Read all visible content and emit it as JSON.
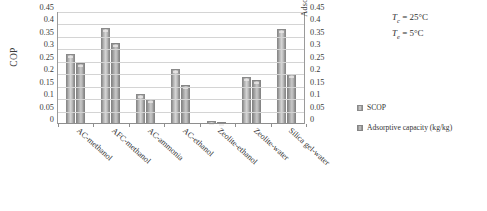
{
  "chart_data": {
    "type": "bar",
    "title": "",
    "categories": [
      "AC-methanol",
      "AFC-methanol",
      "AC-ammonia",
      "AC-ethanol",
      "Zeolite-ethanol",
      "Zeolite-water",
      "Silica gel-water"
    ],
    "series": [
      {
        "name": "SCOP",
        "values": [
          0.28,
          0.385,
          0.12,
          0.22,
          0.012,
          0.19,
          0.38
        ]
      },
      {
        "name": "Adsorptive capacity (kg/kg)",
        "values": [
          0.245,
          0.325,
          0.1,
          0.155,
          0.01,
          0.175,
          0.2
        ]
      }
    ],
    "xlabel": "",
    "ylabel": "COP",
    "y2label": "Adsorptive capacity (kg/kg)",
    "ylim": [
      0,
      0.45
    ],
    "y2lim": [
      0,
      0.45
    ],
    "yticks": [
      "0",
      "0.05",
      "0.1",
      "0.15",
      "0.2",
      "0.25",
      "0.3",
      "0.35",
      "0.4",
      "0.45"
    ],
    "y2ticks": [
      "0",
      "0.05",
      "0.1",
      "0.15",
      "0.2",
      "0.25",
      "0.3",
      "0.35",
      "0.4",
      "0.45"
    ],
    "grid": true,
    "legend_position": "right",
    "legend": [
      "SCOP",
      "Adsorptive capacity (kg/kg)"
    ],
    "annotations": [
      {
        "symbol": "T",
        "subscript": "c",
        "text": " = 25°C"
      },
      {
        "symbol": "T",
        "subscript": "e",
        "text": " = 5°C"
      }
    ]
  },
  "axes": {
    "left_title": "COP",
    "right_title": "Adsorptive capacity (kg/kg)"
  },
  "legend": {
    "items": [
      {
        "label": "SCOP"
      },
      {
        "label": "Adsorptive capacity (kg/kg)"
      }
    ]
  },
  "annotation": {
    "line1_symbol": "T",
    "line1_sub": "c",
    "line1_value": " = 25°C",
    "line2_symbol": "T",
    "line2_sub": "e",
    "line2_value": " = 5°C"
  }
}
